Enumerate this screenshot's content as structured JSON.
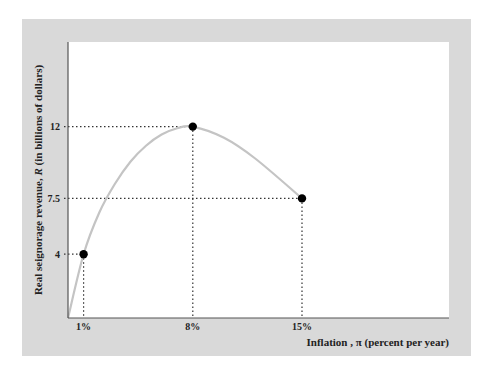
{
  "chart_data": {
    "type": "line",
    "title": "",
    "xlabel": "Inflation , π (percent per year)",
    "ylabel_parts": [
      "Real seignorage revenue, ",
      "R",
      " (in billions of dollars)"
    ],
    "ylabel": "Real seignorage revenue, R (in billions of dollars)",
    "x_ticks": [
      "1%",
      "8%",
      "15%"
    ],
    "y_ticks": [
      "4",
      "7.5",
      "12"
    ],
    "highlighted_points": [
      {
        "x": 1,
        "y": 4
      },
      {
        "x": 8,
        "y": 12
      },
      {
        "x": 15,
        "y": 7.5
      }
    ],
    "curve_points": [
      {
        "x": 0,
        "y": 0
      },
      {
        "x": 1,
        "y": 4
      },
      {
        "x": 2,
        "y": 6.6
      },
      {
        "x": 3,
        "y": 8.4
      },
      {
        "x": 4,
        "y": 9.8
      },
      {
        "x": 5,
        "y": 10.8
      },
      {
        "x": 6,
        "y": 11.5
      },
      {
        "x": 7,
        "y": 11.9
      },
      {
        "x": 8,
        "y": 12
      },
      {
        "x": 10,
        "y": 11.3
      },
      {
        "x": 12,
        "y": 10.0
      },
      {
        "x": 15,
        "y": 7.5
      }
    ],
    "guides": "dotted lines from each highlighted point to both axes",
    "grid": false,
    "legend": null,
    "colors": {
      "frame": "#d9d9d9",
      "plot_bg": "#ffffff",
      "curve": "#c4c4c4",
      "points": "#000000",
      "axis": "#555555"
    }
  }
}
